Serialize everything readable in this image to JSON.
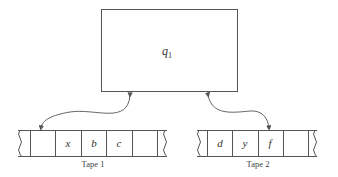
{
  "diagram": {
    "type": "two-tape turing machine",
    "control_unit": {
      "state_label": "q",
      "state_subscript": "1"
    },
    "tapes": [
      {
        "label": "Tape 1",
        "cells": [
          "",
          "x",
          "b",
          "c",
          ""
        ],
        "head_cell_index": 0
      },
      {
        "label": "Tape 2",
        "cells": [
          "d",
          "y",
          "f",
          ""
        ],
        "head_cell_index": 2
      }
    ],
    "colors": {
      "line": "#555555",
      "text": "#333333",
      "background": "#ffffff"
    }
  }
}
